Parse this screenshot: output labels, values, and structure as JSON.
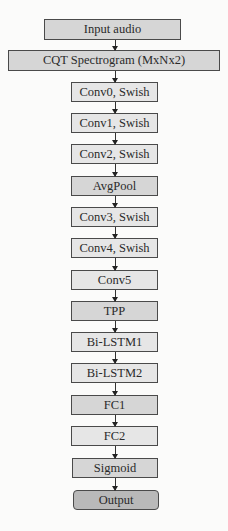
{
  "diagram": {
    "type": "flowchart",
    "direction": "top-to-bottom",
    "nodes": [
      {
        "id": "input",
        "label": "Input audio",
        "style": "mid"
      },
      {
        "id": "cqt",
        "label": "CQT Spectrogram (MxNx2)",
        "style": "mid"
      },
      {
        "id": "conv0",
        "label": "Conv0, Swish",
        "style": "light"
      },
      {
        "id": "conv1",
        "label": "Conv1, Swish",
        "style": "light"
      },
      {
        "id": "conv2",
        "label": "Conv2, Swish",
        "style": "light"
      },
      {
        "id": "avgpool",
        "label": "AvgPool",
        "style": "mid"
      },
      {
        "id": "conv3",
        "label": "Conv3, Swish",
        "style": "light"
      },
      {
        "id": "conv4",
        "label": "Conv4, Swish",
        "style": "light"
      },
      {
        "id": "conv5",
        "label": "Conv5",
        "style": "light"
      },
      {
        "id": "tpp",
        "label": "TPP",
        "style": "mid"
      },
      {
        "id": "bilstm1",
        "label": "Bi-LSTM1",
        "style": "light"
      },
      {
        "id": "bilstm2",
        "label": "Bi-LSTM2",
        "style": "light"
      },
      {
        "id": "fc1",
        "label": "FC1",
        "style": "mid"
      },
      {
        "id": "fc2",
        "label": "FC2",
        "style": "light"
      },
      {
        "id": "sigmoid",
        "label": "Sigmoid",
        "style": "mid"
      },
      {
        "id": "output",
        "label": "Output",
        "style": "dark"
      }
    ],
    "edges": [
      [
        "input",
        "cqt"
      ],
      [
        "cqt",
        "conv0"
      ],
      [
        "conv0",
        "conv1"
      ],
      [
        "conv1",
        "conv2"
      ],
      [
        "conv2",
        "avgpool"
      ],
      [
        "avgpool",
        "conv3"
      ],
      [
        "conv3",
        "conv4"
      ],
      [
        "conv4",
        "conv5"
      ],
      [
        "conv5",
        "tpp"
      ],
      [
        "tpp",
        "bilstm1"
      ],
      [
        "bilstm1",
        "bilstm2"
      ],
      [
        "bilstm2",
        "fc1"
      ],
      [
        "fc1",
        "fc2"
      ],
      [
        "fc2",
        "sigmoid"
      ],
      [
        "sigmoid",
        "output"
      ]
    ]
  }
}
